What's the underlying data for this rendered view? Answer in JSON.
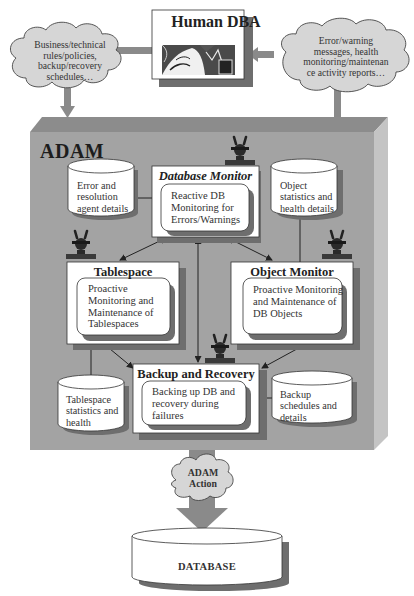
{
  "diagram": {
    "human_dba": {
      "title": "Human DBA",
      "image": "person-at-computer-illustration"
    },
    "left_cloud": {
      "lines": [
        "Business/technical",
        "rules/policies,",
        "backup/recovery",
        "schedules…"
      ]
    },
    "right_cloud": {
      "lines": [
        "Error/warning",
        "messages, health",
        "monitoring/maintenan",
        "ce activity reports…"
      ]
    },
    "system": {
      "title": "ADAM"
    },
    "agents": {
      "database_monitor": {
        "title": "Database Monitor",
        "lines": [
          "Reactive DB",
          "Monitoring for",
          "Errors/Warnings"
        ]
      },
      "tablespace": {
        "title": "Tablespace",
        "lines": [
          "Proactive",
          "Monitoring and",
          "Maintenance of",
          "Tablespaces"
        ]
      },
      "object_monitor": {
        "title": "Object Monitor",
        "lines": [
          "Proactive Monitoring",
          "and Maintenance of",
          "DB Objects"
        ]
      },
      "backup_recovery": {
        "title": "Backup and Recovery",
        "lines": [
          "Backing up DB and",
          "recovery during",
          "failures"
        ]
      }
    },
    "stores": {
      "error_resolution": {
        "lines": [
          "Error and",
          "resolution",
          "agent details"
        ]
      },
      "object_stats": {
        "lines": [
          "Object",
          "statistics and",
          "health details"
        ]
      },
      "tablespace_stats": {
        "lines": [
          "Tablespace",
          "statistics and",
          "health"
        ]
      },
      "backup_schedules": {
        "lines": [
          "Backup",
          "schedules and",
          "details"
        ]
      }
    },
    "action_cloud": {
      "lines": [
        "ADAM",
        "Action"
      ]
    },
    "database": {
      "label": "DATABASE"
    },
    "colors": {
      "adam_front": "#a3a3a3",
      "adam_top": "#8c8c8c",
      "adam_side": "#c4c4c4",
      "cloud_fill": "#d6d6d6",
      "arrow_gray": "#8a8a8a",
      "shadow": "#6e6e6e",
      "box_fill": "#ffffff",
      "text": "#222222"
    }
  }
}
